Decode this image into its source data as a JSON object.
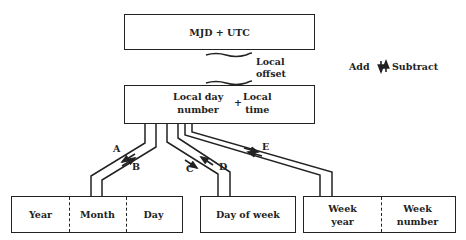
{
  "top_box": {
    "label": "MJD + UTC"
  },
  "offset_label": {
    "line1": "Local",
    "line2": "offset"
  },
  "legend": {
    "add": "Add",
    "subtract": "Subtract",
    "icon": "up-down-arrows-icon"
  },
  "middle_box": {
    "left_line1": "Local day",
    "left_line2": "number",
    "plus": "+",
    "right_line1": "Local",
    "right_line2": "time"
  },
  "paths": [
    {
      "label": "A",
      "to": "Year Month Day",
      "direction": "to-middle"
    },
    {
      "label": "B",
      "to": "Year Month Day",
      "direction": "to-bottom"
    },
    {
      "label": "C",
      "to": "Day of week",
      "direction": "to-bottom"
    },
    {
      "label": "D",
      "to": "Day of week",
      "direction": "to-middle"
    },
    {
      "label": "E",
      "to": "Week year / Week number",
      "direction": "both"
    }
  ],
  "bottom_boxes": {
    "calendar": {
      "cells": [
        "Year",
        "Month",
        "Day"
      ]
    },
    "day_of_week": {
      "label": "Day of week"
    },
    "week": {
      "cell1_line1": "Week",
      "cell1_line2": "year",
      "cell2_line1": "Week",
      "cell2_line2": "number"
    }
  }
}
